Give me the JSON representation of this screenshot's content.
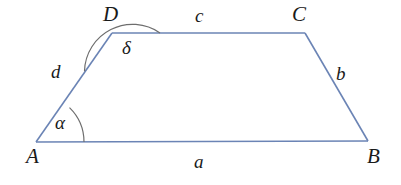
{
  "figure": {
    "type": "geometry-diagram",
    "shape": "trapezoid",
    "background_color": "#ffffff",
    "line_color": "#6b84b5",
    "arc_color": "#6e6e6e",
    "text_color": "#1a1a1a",
    "width": 401,
    "height": 185
  },
  "vertices": [
    {
      "id": "A",
      "label": "A",
      "x": 36,
      "y": 142
    },
    {
      "id": "B",
      "label": "B",
      "x": 368,
      "y": 141
    },
    {
      "id": "C",
      "label": "C",
      "x": 305,
      "y": 33
    },
    {
      "id": "D",
      "label": "D",
      "x": 112,
      "y": 33
    }
  ],
  "sides": [
    {
      "id": "a",
      "label": "a",
      "from": "A",
      "to": "B"
    },
    {
      "id": "b",
      "label": "b",
      "from": "B",
      "to": "C"
    },
    {
      "id": "c",
      "label": "c",
      "from": "C",
      "to": "D"
    },
    {
      "id": "d",
      "label": "d",
      "from": "D",
      "to": "A"
    }
  ],
  "angles": [
    {
      "id": "alpha",
      "label": "α",
      "at_vertex": "A",
      "kind": "acute"
    },
    {
      "id": "delta",
      "label": "δ",
      "at_vertex": "D",
      "kind": "obtuse"
    }
  ]
}
